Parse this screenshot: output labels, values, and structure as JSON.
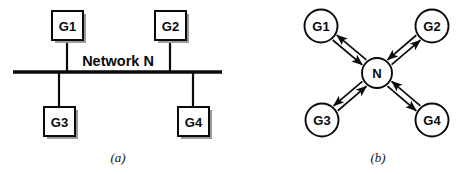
{
  "figure": {
    "width": 462,
    "height": 174,
    "background_color": "#ffffff",
    "ink_color": "#0a0a0a",
    "shadow_color": "#9a9a9a"
  },
  "panels": [
    {
      "id": "panel-a",
      "caption": "(a)",
      "caption_pos": {
        "x": 118,
        "y": 162
      },
      "topology": "bus",
      "bus": {
        "label": "Network N",
        "label_pos": {
          "x": 118,
          "y": 66
        },
        "line": {
          "x1": 13,
          "y1": 72,
          "x2": 222,
          "y2": 72
        }
      },
      "nodes": [
        {
          "id": "G1",
          "label": "G1",
          "shape": "square",
          "x": 52,
          "y": 11,
          "w": 31,
          "h": 29,
          "side": "top",
          "stem": {
            "x1": 67,
            "y1": 40,
            "x2": 67,
            "y2": 72
          }
        },
        {
          "id": "G2",
          "label": "G2",
          "shape": "square",
          "x": 155,
          "y": 11,
          "w": 31,
          "h": 29,
          "side": "top",
          "stem": {
            "x1": 170,
            "y1": 40,
            "x2": 170,
            "y2": 72
          }
        },
        {
          "id": "G3",
          "label": "G3",
          "shape": "square",
          "x": 44,
          "y": 107,
          "w": 31,
          "h": 29,
          "side": "bottom",
          "stem": {
            "x1": 59,
            "y1": 72,
            "x2": 59,
            "y2": 107
          }
        },
        {
          "id": "G4",
          "label": "G4",
          "shape": "square",
          "x": 178,
          "y": 107,
          "w": 31,
          "h": 29,
          "side": "bottom",
          "stem": {
            "x1": 193,
            "y1": 72,
            "x2": 193,
            "y2": 107
          }
        }
      ]
    },
    {
      "id": "panel-b",
      "caption": "(b)",
      "caption_pos": {
        "x": 378,
        "y": 162
      },
      "topology": "star",
      "hub": {
        "id": "N",
        "label": "N",
        "shape": "circle",
        "cx": 377,
        "cy": 73,
        "r": 15
      },
      "nodes": [
        {
          "id": "G1",
          "label": "G1",
          "shape": "circle",
          "cx": 321,
          "cy": 26,
          "r": 16.5
        },
        {
          "id": "G2",
          "label": "G2",
          "shape": "circle",
          "cx": 432,
          "cy": 26,
          "r": 16.5
        },
        {
          "id": "G3",
          "label": "G3",
          "shape": "circle",
          "cx": 322,
          "cy": 120,
          "r": 16.5
        },
        {
          "id": "G4",
          "label": "G4",
          "shape": "circle",
          "cx": 432,
          "cy": 120,
          "r": 16.5
        }
      ],
      "links": [
        {
          "from": "N",
          "to": "G1",
          "bidirectional": true
        },
        {
          "from": "N",
          "to": "G2",
          "bidirectional": true
        },
        {
          "from": "N",
          "to": "G3",
          "bidirectional": true
        },
        {
          "from": "N",
          "to": "G4",
          "bidirectional": true
        }
      ]
    }
  ]
}
